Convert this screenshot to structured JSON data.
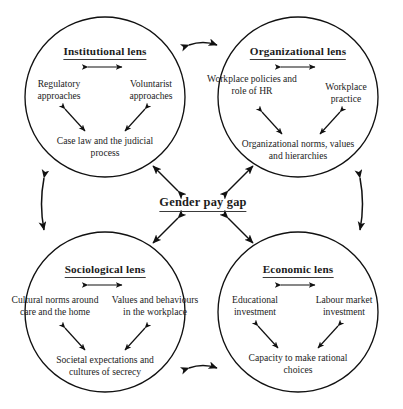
{
  "figure": {
    "caption_fragment": "",
    "center_label": "Gender pay gap",
    "background_color": "#ffffff",
    "stroke_color": "#111111",
    "text_color": "#1c1c1c"
  },
  "lenses": {
    "institutional": {
      "title": "Institutional lens",
      "nodes": {
        "left": "Regulatory approaches",
        "right": "Voluntarist approaches",
        "bottom": "Case law and the judicial process"
      }
    },
    "organizational": {
      "title": "Organizational lens",
      "nodes": {
        "left": "Workplace policies and role of HR",
        "right": "Workplace practice",
        "bottom": "Organizational norms, values and hierarchies"
      }
    },
    "sociological": {
      "title": "Sociological lens",
      "nodes": {
        "left": "Cultural norms around care and the home",
        "right": "Values and behaviours in the workplace",
        "bottom": "Societal expectations and cultures of secrecy"
      }
    },
    "economic": {
      "title": "Economic lens",
      "nodes": {
        "left": "Educational investment",
        "right": "Labour market investment",
        "bottom": "Capacity to make rational choices"
      }
    }
  },
  "connectors": {
    "top_horizontal": "double-headed-arrow",
    "bottom_horizontal": "double-headed-arrow",
    "left_vertical": "double-headed-arrow",
    "right_vertical": "double-headed-arrow",
    "center_to_institutional": "double-headed-arrow",
    "center_to_organizational": "double-headed-arrow",
    "center_to_sociological": "double-headed-arrow",
    "center_to_economic": "double-headed-arrow"
  }
}
